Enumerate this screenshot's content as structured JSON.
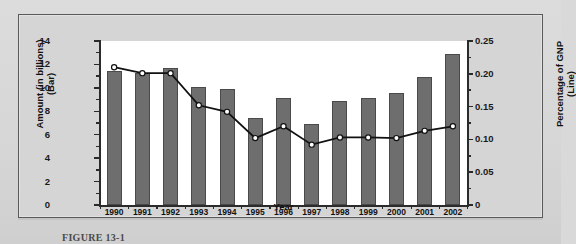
{
  "figure": {
    "caption": "FIGURE 13-1"
  },
  "chart_data": {
    "type": "bar",
    "title": "",
    "xlabel": "Year",
    "ylabel": "Amount (in billions) (Bar)",
    "y2label": "Percentage of GNP (Line)",
    "ylim": [
      0,
      14
    ],
    "y2lim": [
      0,
      0.25
    ],
    "grid": false,
    "legend": "none",
    "categories": [
      "1990",
      "1991",
      "1992",
      "1993",
      "1994",
      "1995",
      "1996",
      "1997",
      "1998",
      "1999",
      "2000",
      "2001",
      "2002"
    ],
    "series": [
      {
        "name": "Amount (in billions)",
        "axis": "left",
        "type": "bar",
        "color": "#6e6e6e",
        "values": [
          11.4,
          11.3,
          11.7,
          10.1,
          9.9,
          7.4,
          9.15,
          6.9,
          8.85,
          9.1,
          9.6,
          10.9,
          12.9
        ]
      },
      {
        "name": "Percentage of GNP",
        "axis": "right",
        "type": "line",
        "color": "#111111",
        "marker": "open-circle",
        "values": [
          0.21,
          0.201,
          0.201,
          0.152,
          0.142,
          0.102,
          0.12,
          0.092,
          0.103,
          0.103,
          0.102,
          0.113,
          0.12
        ]
      }
    ],
    "y_ticks_left": [
      "0",
      "2",
      "4",
      "6",
      "8",
      "10",
      "12",
      "14"
    ],
    "y_ticks_right": [
      "0",
      "0.05",
      "0.10",
      "0.15",
      "0.20",
      "0.25"
    ],
    "x_tick_labels": [
      "1990",
      "1991",
      "1992",
      "1993",
      "1994",
      "1995",
      "1996",
      "1997",
      "1998",
      "1999",
      "2000",
      "2001",
      "2002"
    ]
  }
}
